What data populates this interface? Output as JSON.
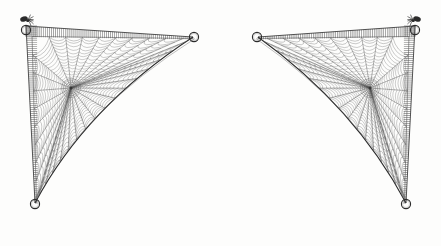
{
  "figure": {
    "kind": "scientific-illustration",
    "background_color": "#fdfdfc",
    "ink_color": "#2b2b2b",
    "thread_color": "#575757",
    "hatch_color": "#4a4a4a",
    "canvas": {
      "width": 441,
      "height": 246
    }
  },
  "panels": [
    {
      "id": "left-web",
      "name": "left-corner-web",
      "mirrored": false,
      "frame": {
        "corner": {
          "x": 26,
          "y": 26
        },
        "top_tip": {
          "x": 193,
          "y": 37
        },
        "bottom_tip": {
          "x": 35,
          "y": 203
        },
        "top_edge_hatch": "vertical",
        "side_edge_hatch": "horizontal",
        "hatch_band_width": 11,
        "top_hatch_count": 86,
        "side_hatch_count": 88
      },
      "hub": {
        "x": 71,
        "y": 88
      },
      "radii_count": 34,
      "spiral_turns": 17,
      "rings": [
        {
          "name": "anchor-ring-corner",
          "x": 26,
          "y": 30,
          "r": 4.6
        },
        {
          "name": "anchor-ring-top-tip",
          "x": 194,
          "y": 37,
          "r": 4.6
        },
        {
          "name": "anchor-ring-bottom-tip",
          "x": 35,
          "y": 204,
          "r": 4.6
        }
      ],
      "spider": {
        "name": "spider",
        "x": 24,
        "y": 19,
        "size": 7.5
      },
      "outer_edge": {
        "from": {
          "x": 193,
          "y": 37
        },
        "to": {
          "x": 35,
          "y": 203
        },
        "control": {
          "x": 86,
          "y": 107
        },
        "shape": "concave-catenary"
      }
    },
    {
      "id": "right-web",
      "name": "right-corner-web",
      "mirrored": true,
      "frame": {
        "corner": {
          "x": 415,
          "y": 26
        },
        "top_tip": {
          "x": 258,
          "y": 37
        },
        "bottom_tip": {
          "x": 406,
          "y": 203
        },
        "top_edge_hatch": "vertical",
        "side_edge_hatch": "horizontal",
        "hatch_band_width": 11,
        "top_hatch_count": 86,
        "side_hatch_count": 88
      },
      "hub": {
        "x": 370,
        "y": 88
      },
      "radii_count": 34,
      "spiral_turns": 17,
      "rings": [
        {
          "name": "anchor-ring-corner",
          "x": 415,
          "y": 30,
          "r": 4.6
        },
        {
          "name": "anchor-ring-top-tip",
          "x": 257,
          "y": 37,
          "r": 4.6
        },
        {
          "name": "anchor-ring-bottom-tip",
          "x": 406,
          "y": 204,
          "r": 4.6
        }
      ],
      "spider": {
        "name": "spider",
        "x": 417,
        "y": 19,
        "size": 7.5
      },
      "outer_edge": {
        "from": {
          "x": 258,
          "y": 37
        },
        "to": {
          "x": 406,
          "y": 203
        },
        "control": {
          "x": 355,
          "y": 107
        },
        "shape": "concave-catenary"
      }
    }
  ],
  "labels": {
    "plate_title": "",
    "left_panel_label": "",
    "right_panel_label": "",
    "caption": ""
  }
}
